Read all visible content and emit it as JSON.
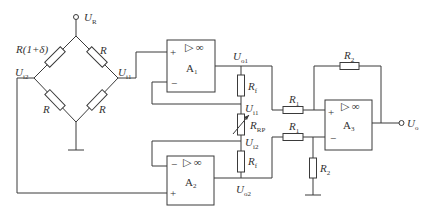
{
  "diagram": {
    "type": "circuit-schematic",
    "supply": {
      "label": "U",
      "sub": "R"
    },
    "output": {
      "label": "U",
      "sub": "o"
    },
    "bridge": {
      "top_left": {
        "label": "R(1+δ)"
      },
      "top_right": {
        "label": "R"
      },
      "bottom_left": {
        "label": "R"
      },
      "bottom_right": {
        "label": "R"
      },
      "left_node": {
        "label": "U",
        "sub": "i2"
      },
      "right_node": {
        "label": "U",
        "sub": "i1"
      }
    },
    "amplifiers": [
      {
        "id": "A1",
        "label": "A",
        "sub": "1",
        "plus": "+",
        "minus": "−",
        "gain": "▷ ∞"
      },
      {
        "id": "A2",
        "label": "A",
        "sub": "2",
        "plus": "+",
        "minus": "−",
        "gain": "▷ ∞"
      },
      {
        "id": "A3",
        "label": "A",
        "sub": "3",
        "plus": "+",
        "minus": "−",
        "gain": "▷ ∞"
      }
    ],
    "nodes": {
      "uo1": {
        "label": "U",
        "sub": "o1"
      },
      "uo2": {
        "label": "U",
        "sub": "o2"
      },
      "ui1": {
        "label": "U",
        "sub": "i1"
      },
      "ui2": {
        "label": "U",
        "sub": "i2"
      }
    },
    "resistors": {
      "rf_top": {
        "label": "R",
        "sub": "f"
      },
      "rrp": {
        "label": "R",
        "sub": "RP"
      },
      "rf_bottom": {
        "label": "R",
        "sub": "f"
      },
      "r1_top": {
        "label": "R",
        "sub": "1"
      },
      "r1_bottom": {
        "label": "R",
        "sub": "1"
      },
      "r2_feedback": {
        "label": "R",
        "sub": "2"
      },
      "r2_ground": {
        "label": "R",
        "sub": "2"
      }
    }
  }
}
